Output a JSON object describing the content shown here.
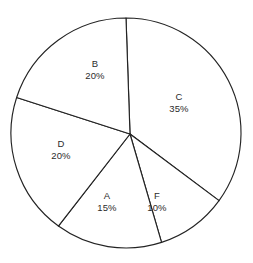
{
  "chart_data": {
    "type": "pie",
    "title": "",
    "subtitle": "",
    "xlabel": "",
    "ylabel": "",
    "legend": "none",
    "grid": false,
    "units": "percent",
    "total": 100,
    "start_angle_deg": 0,
    "direction": "clockwise",
    "categories": [
      "C",
      "F",
      "A",
      "D",
      "B"
    ],
    "values": [
      35,
      10,
      15,
      20,
      20
    ],
    "slices": [
      {
        "name": "C",
        "value": 35,
        "value_label": "35%",
        "label_x": 179,
        "label_y": 103
      },
      {
        "name": "F",
        "value": 10,
        "value_label": "10%",
        "label_x": 157,
        "label_y": 202
      },
      {
        "name": "A",
        "value": 15,
        "value_label": "15%",
        "label_x": 107,
        "label_y": 202
      },
      {
        "name": "D",
        "value": 20,
        "value_label": "20%",
        "label_x": 61,
        "label_y": 150
      },
      {
        "name": "B",
        "value": 20,
        "value_label": "20%",
        "label_x": 95,
        "label_y": 70
      }
    ],
    "geometry": {
      "center_x": 126,
      "center_y": 133,
      "radius": 115,
      "hub_x": 130,
      "hub_y": 134
    },
    "colors": {
      "background": "#ffffff",
      "slice_fill": "#ffffff",
      "outline": "#232323",
      "text": "#2b2b2b"
    }
  }
}
